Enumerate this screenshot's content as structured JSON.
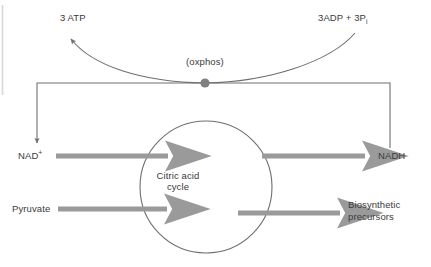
{
  "diagram": {
    "colors": {
      "arrow_gray": "#9a9a9a",
      "line_gray": "#6e6e6e",
      "node_gray": "#808080",
      "text_gray": "#3a3a3a",
      "background": "#ffffff",
      "margin_rule": "#d8d8d8"
    },
    "labels": {
      "atp": "3 ATP",
      "adp_pi_prefix": "3ADP + 3P",
      "adp_pi_subscript": "i",
      "oxphos": "(oxphos)",
      "nad_plus_base": "NAD",
      "nad_plus_superscript": "+",
      "nadh": "NADH",
      "pyruvate": "Pyruvate",
      "cycle_line1": "Citric acid",
      "cycle_line2": "cycle",
      "biosynthetic_line1": "Biosynthetic",
      "biosynthetic_line2": "precursors"
    },
    "nodes": [
      {
        "name": "oxphos-node",
        "label": "(oxphos)",
        "x": 205,
        "y": 83
      },
      {
        "name": "citric-acid-cycle-circle",
        "label": "Citric acid cycle",
        "cx": 206,
        "cy": 187,
        "r": 66
      }
    ],
    "flows": [
      {
        "name": "nad-to-cycle",
        "from": "NAD+",
        "to": "Citric acid cycle",
        "style": "thick-gray-arrow"
      },
      {
        "name": "cycle-to-nadh",
        "from": "Citric acid cycle",
        "to": "NADH",
        "style": "thick-gray-arrow"
      },
      {
        "name": "pyruvate-to-cycle",
        "from": "Pyruvate",
        "to": "Citric acid cycle",
        "style": "thick-gray-arrow"
      },
      {
        "name": "cycle-to-biosynthetic",
        "from": "Citric acid cycle",
        "to": "Biosynthetic precursors",
        "style": "thick-gray-arrow"
      },
      {
        "name": "nadh-recycle-to-nad",
        "from": "NADH",
        "to": "NAD+",
        "style": "thin-rect-path-arrow"
      },
      {
        "name": "adp-to-atp-oxphos",
        "from": "3ADP + 3Pi",
        "to": "3 ATP",
        "style": "thin-curve-arrow"
      }
    ]
  }
}
